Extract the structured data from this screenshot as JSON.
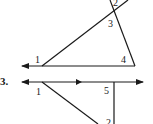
{
  "problem_number": "3.",
  "figure_top": {
    "angle_labels": [
      "1",
      "2",
      "3",
      "4"
    ]
  },
  "figure_bottom": {
    "angle_labels": [
      "1",
      "5",
      "2"
    ]
  },
  "colors": {
    "stroke": "#1a1a1a",
    "background": "#ffffff"
  }
}
